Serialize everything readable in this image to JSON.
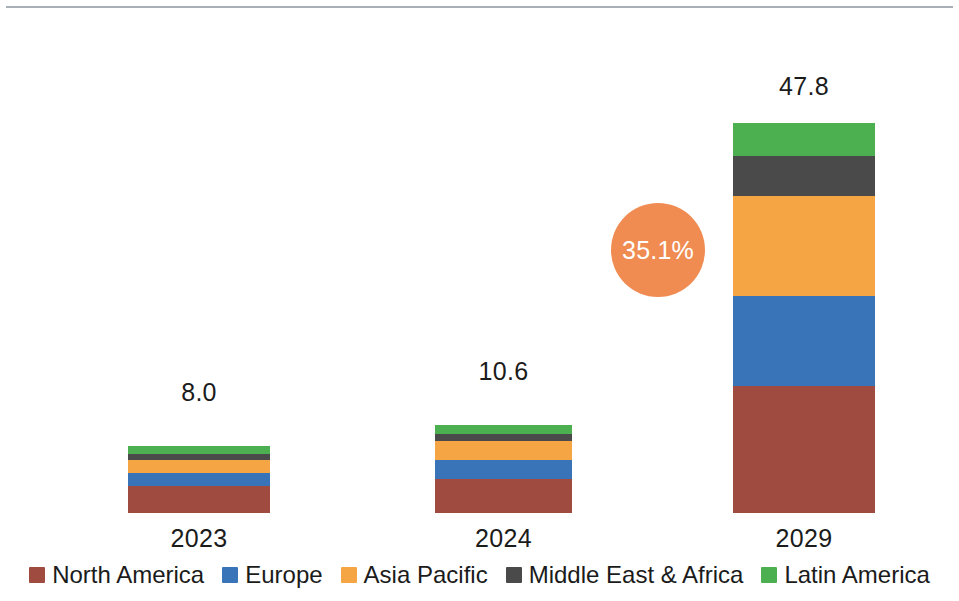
{
  "chart_data": {
    "type": "bar",
    "subtype": "stacked-bar",
    "title": "",
    "subtitle": "",
    "xlabel": "",
    "ylabel": "",
    "grid": false,
    "axis_visible": false,
    "legend_position": "bottom",
    "ylim": [
      0,
      47.8
    ],
    "categories": [
      "2023",
      "2024",
      "2029"
    ],
    "totals": [
      "8.0",
      "10.6",
      "47.8"
    ],
    "totals_numeric": [
      8.0,
      10.6,
      47.8
    ],
    "series": [
      {
        "name": "North America",
        "color": "#A04B40",
        "values": [
          3.2,
          4.0,
          15.3
        ]
      },
      {
        "name": "Europe",
        "color": "#3A74B8",
        "values": [
          1.6,
          2.3,
          11.0
        ]
      },
      {
        "name": "Asia Pacific",
        "color": "#F5A543",
        "values": [
          1.6,
          2.3,
          12.0
        ]
      },
      {
        "name": "Middle East & Africa",
        "color": "#4A4A4A",
        "values": [
          0.7,
          0.9,
          4.8
        ]
      },
      {
        "name": "Latin America",
        "color": "#4CAF50",
        "values": [
          0.9,
          1.1,
          4.7
        ]
      }
    ],
    "annotations": [
      {
        "name": "cagr-bubble",
        "text": "35.1%",
        "color": "#F08C52",
        "text_color": "#FFFFFF"
      }
    ]
  },
  "bars": [
    {
      "category": "2023",
      "total_label": "8.0",
      "left": 128,
      "width": 142,
      "total_label_top": 378,
      "segments": [
        {
          "name": "Latin America",
          "color": "#4CAF50",
          "height": 8
        },
        {
          "name": "Middle East & Africa",
          "color": "#4A4A4A",
          "height": 6
        },
        {
          "name": "Asia Pacific",
          "color": "#F5A543",
          "height": 13
        },
        {
          "name": "Europe",
          "color": "#3A74B8",
          "height": 13
        },
        {
          "name": "North America",
          "color": "#A04B40",
          "height": 27
        }
      ]
    },
    {
      "category": "2024",
      "total_label": "10.6",
      "left": 435,
      "width": 137,
      "total_label_top": 357,
      "segments": [
        {
          "name": "Latin America",
          "color": "#4CAF50",
          "height": 9
        },
        {
          "name": "Middle East & Africa",
          "color": "#4A4A4A",
          "height": 7
        },
        {
          "name": "Asia Pacific",
          "color": "#F5A543",
          "height": 19
        },
        {
          "name": "Europe",
          "color": "#3A74B8",
          "height": 19
        },
        {
          "name": "North America",
          "color": "#A04B40",
          "height": 34
        }
      ]
    },
    {
      "category": "2029",
      "total_label": "47.8",
      "left": 733,
      "width": 142,
      "total_label_top": 72,
      "segments": [
        {
          "name": "Latin America",
          "color": "#4CAF50",
          "height": 33
        },
        {
          "name": "Middle East & Africa",
          "color": "#4A4A4A",
          "height": 40
        },
        {
          "name": "Asia Pacific",
          "color": "#F5A543",
          "height": 100
        },
        {
          "name": "Europe",
          "color": "#3A74B8",
          "height": 90
        },
        {
          "name": "North America",
          "color": "#A04B40",
          "height": 127
        }
      ]
    }
  ],
  "cagr": {
    "label": "35.1%",
    "left": 611,
    "top": 203,
    "size": 94,
    "color": "#F08C52",
    "text_color": "#FFFFFF"
  },
  "legend": {
    "items": [
      {
        "label": "North America",
        "color": "#A04B40"
      },
      {
        "label": "Europe",
        "color": "#3A74B8"
      },
      {
        "label": "Asia Pacific",
        "color": "#F5A543"
      },
      {
        "label": "Middle East & Africa",
        "color": "#4A4A4A"
      },
      {
        "label": "Latin America",
        "color": "#4CAF50"
      }
    ]
  }
}
